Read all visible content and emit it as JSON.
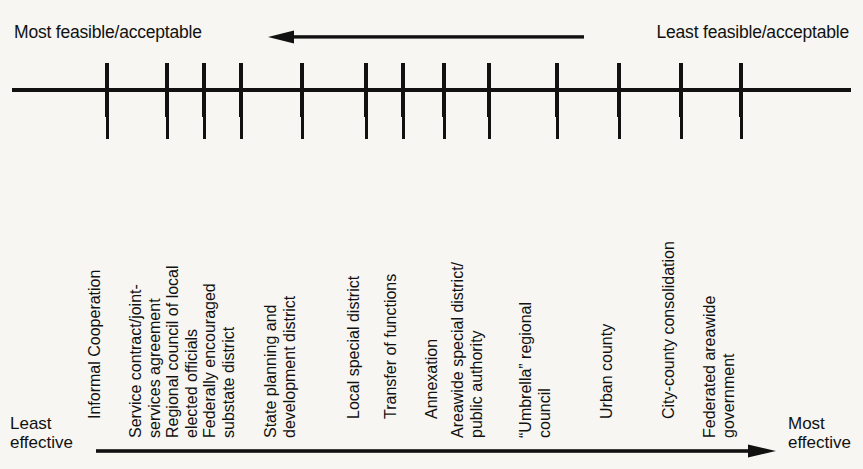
{
  "diagram": {
    "type": "ordered-scale-continuum",
    "top_axis": {
      "left_label": "Most feasible/acceptable",
      "right_label": "Least feasible/acceptable",
      "arrow_direction": "left",
      "arrow_name": "feasibility-arrow"
    },
    "bottom_axis": {
      "left_label_line1": "Least",
      "left_label_line2": "effective",
      "right_label_line1": "Most",
      "right_label_line2": "effective",
      "arrow_direction": "right",
      "arrow_name": "effectiveness-arrow"
    },
    "items": [
      {
        "index": 1,
        "x": 107,
        "lines": [
          "Informal Cooperation"
        ]
      },
      {
        "index": 2,
        "x": 167,
        "lines": [
          "Service contract/joint-",
          "services agreement"
        ]
      },
      {
        "index": 3,
        "x": 204,
        "lines": [
          "Regional council of local",
          "elected officials"
        ]
      },
      {
        "index": 4,
        "x": 241,
        "lines": [
          "Federally encouraged",
          "substate district"
        ]
      },
      {
        "index": 5,
        "x": 302,
        "lines": [
          "State planning and",
          "development district"
        ]
      },
      {
        "index": 6,
        "x": 366,
        "lines": [
          "Local special district"
        ]
      },
      {
        "index": 7,
        "x": 403,
        "lines": [
          "Transfer of functions"
        ]
      },
      {
        "index": 8,
        "x": 444,
        "lines": [
          "Annexation"
        ]
      },
      {
        "index": 9,
        "x": 489,
        "lines": [
          "Areawide special district/",
          "public authority"
        ]
      },
      {
        "index": 10,
        "x": 557,
        "lines": [
          "“Umbrella” regional",
          "council"
        ]
      },
      {
        "index": 11,
        "x": 619,
        "lines": [
          "Urban county"
        ]
      },
      {
        "index": 12,
        "x": 681,
        "lines": [
          "City-county consolidation"
        ]
      },
      {
        "index": 13,
        "x": 741,
        "lines": [
          "Federated areawide",
          "government"
        ]
      }
    ],
    "colors": {
      "ink": "#111111",
      "paper": "#f7f6f2"
    }
  }
}
